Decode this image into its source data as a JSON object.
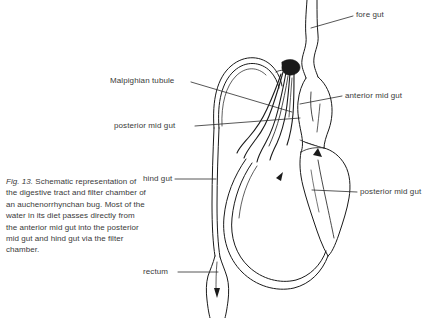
{
  "figure": {
    "caption_fig_number": "Fig. 13.",
    "caption_text": " Schematic representation of the digestive tract and filter chamber of an auchenorrhynchan bug. Most of the water in its diet passes directly from the anterior mid gut into the posterior mid gut and hind gut via the filter chamber.",
    "line_color": "#1a1a1a",
    "text_color": "#3a3a3a",
    "background_color": "#ffffff"
  },
  "labels": {
    "fore_gut": "fore gut",
    "anterior_mid_gut": "anterior mid gut",
    "posterior_mid_gut_right": "posterior mid gut",
    "malpighian_tubule": "Malpighian tubule",
    "posterior_mid_gut_left": "posterior mid gut",
    "hind_gut": "hind gut",
    "rectum": "rectum"
  }
}
